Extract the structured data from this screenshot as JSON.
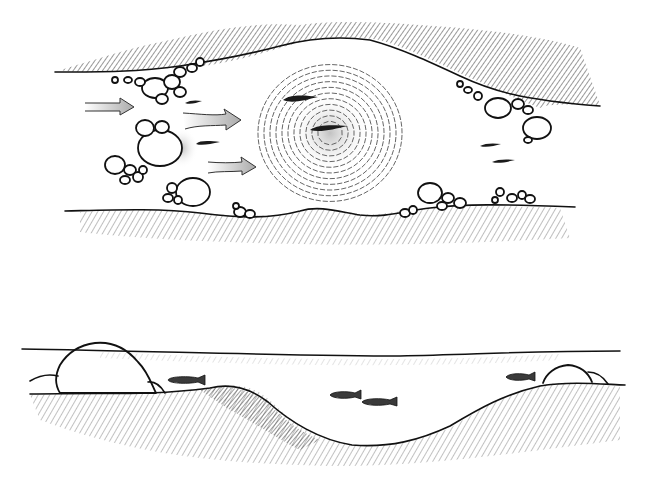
{
  "illustration": {
    "panels": [
      {
        "id": "plan-view",
        "description": "Top-down view of a stream with current arrows, boulders, fish, and a swirling pool"
      },
      {
        "id": "cross-section",
        "description": "Side cross-section of stream bed with water surface, boulders, deep hollow, and fish"
      }
    ],
    "colors": {
      "background": "#ffffff",
      "ink": "#111111",
      "shading": "#555555"
    },
    "plan_view": {
      "current_arrows": [
        {
          "x1": 85,
          "y1": 107,
          "x2": 133,
          "y2": 107
        },
        {
          "x1": 185,
          "y1": 122,
          "x2": 240,
          "y2": 120
        },
        {
          "x1": 208,
          "y1": 167,
          "x2": 255,
          "y2": 167
        }
      ],
      "fish": [
        {
          "cx": 300,
          "cy": 100,
          "len": 35
        },
        {
          "cx": 327,
          "cy": 128,
          "len": 35
        },
        {
          "cx": 193,
          "cy": 103,
          "len": 16
        },
        {
          "cx": 207,
          "cy": 143,
          "len": 22
        },
        {
          "cx": 490,
          "cy": 146,
          "len": 20
        },
        {
          "cx": 503,
          "cy": 162,
          "len": 20
        }
      ],
      "pool": {
        "cx": 330,
        "cy": 133,
        "r": 75
      }
    },
    "cross_section": {
      "water_surface_y": 350,
      "fish": [
        {
          "cx": 188,
          "cy": 380,
          "len": 36
        },
        {
          "cx": 345,
          "cy": 395,
          "len": 30
        },
        {
          "cx": 380,
          "cy": 401,
          "len": 34
        },
        {
          "cx": 520,
          "cy": 377,
          "len": 30
        }
      ]
    }
  }
}
